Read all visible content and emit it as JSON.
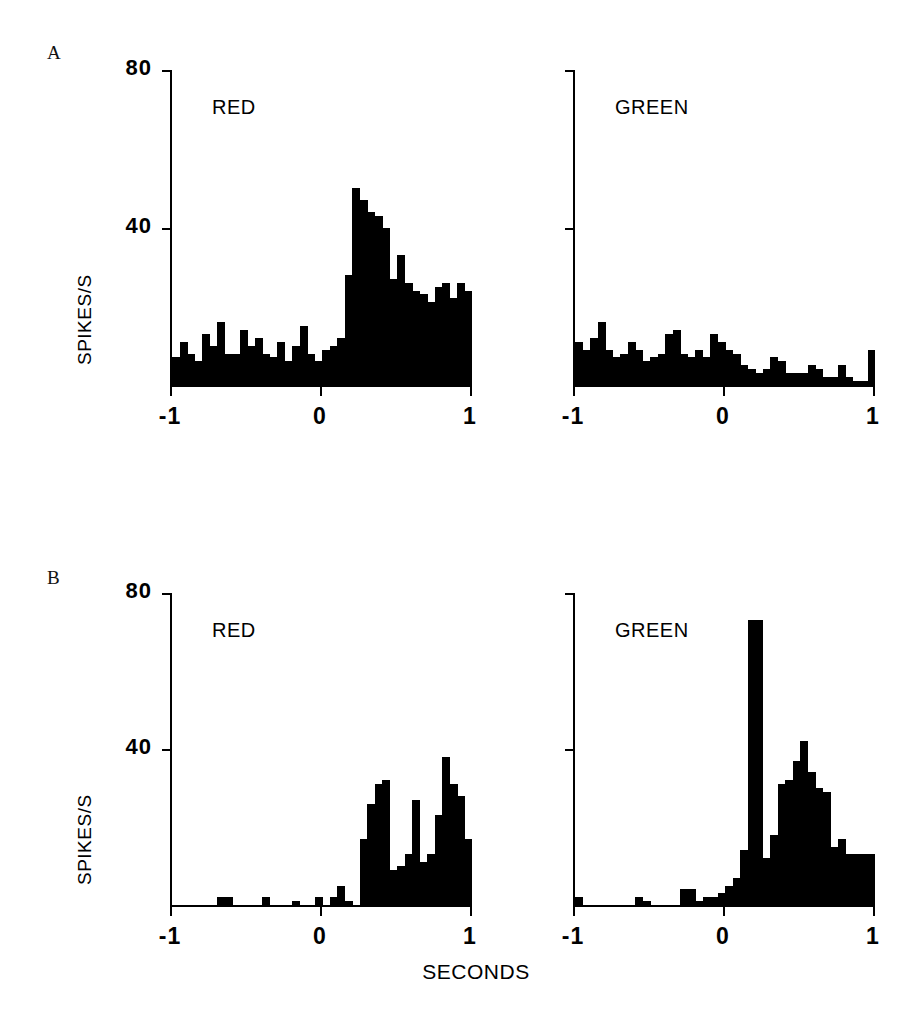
{
  "figure": {
    "panels": [
      {
        "letter": "A",
        "axis_title_y": "SPIKES/S",
        "plots": [
          {
            "condition": "RED",
            "y_ticks": [
              "80",
              "40"
            ],
            "x_ticks": [
              "-1",
              "0",
              "1"
            ]
          },
          {
            "condition": "GREEN",
            "y_ticks": [
              "",
              ""
            ],
            "x_ticks": [
              "-1",
              "0",
              "1"
            ]
          }
        ]
      },
      {
        "letter": "B",
        "axis_title_y": "SPIKES/S",
        "plots": [
          {
            "condition": "RED",
            "y_ticks": [
              "80",
              "40"
            ],
            "x_ticks": [
              "-1",
              "0",
              "1"
            ]
          },
          {
            "condition": "GREEN",
            "y_ticks": [
              "",
              ""
            ],
            "x_ticks": [
              "-1",
              "0",
              "1"
            ]
          }
        ]
      }
    ],
    "axis_title_x": "SECONDS",
    "ink_color": "#000000"
  },
  "chart_data": [
    {
      "type": "bar",
      "title": "A RED",
      "panel": "A",
      "condition": "RED",
      "xlabel": "SECONDS",
      "ylabel": "SPIKES/S",
      "xlim": [
        -1,
        1
      ],
      "ylim": [
        0,
        80
      ],
      "yticks": [
        40,
        80
      ],
      "xticks": [
        -1,
        0,
        1
      ],
      "grid": false,
      "bin_width": 0.05,
      "x": [
        -1.0,
        -0.95,
        -0.9,
        -0.85,
        -0.8,
        -0.75,
        -0.7,
        -0.65,
        -0.6,
        -0.55,
        -0.5,
        -0.45,
        -0.4,
        -0.35,
        -0.3,
        -0.25,
        -0.2,
        -0.15,
        -0.1,
        -0.05,
        0.0,
        0.05,
        0.1,
        0.15,
        0.2,
        0.25,
        0.3,
        0.35,
        0.4,
        0.45,
        0.5,
        0.55,
        0.6,
        0.65,
        0.7,
        0.75,
        0.8,
        0.85,
        0.9,
        0.95
      ],
      "values": [
        7,
        11,
        8,
        6,
        13,
        10,
        16,
        8,
        8,
        14,
        10,
        12,
        8,
        7,
        11,
        6,
        10,
        15,
        8,
        6,
        9,
        10,
        12,
        28,
        50,
        47,
        44,
        43,
        40,
        27,
        33,
        26,
        24,
        23,
        21,
        25,
        26,
        22,
        26,
        24
      ]
    },
    {
      "type": "bar",
      "title": "A GREEN",
      "panel": "A",
      "condition": "GREEN",
      "xlabel": "SECONDS",
      "ylabel": "SPIKES/S",
      "xlim": [
        -1,
        1
      ],
      "ylim": [
        0,
        80
      ],
      "yticks": [
        40,
        80
      ],
      "xticks": [
        -1,
        0,
        1
      ],
      "grid": false,
      "bin_width": 0.05,
      "x": [
        -1.0,
        -0.95,
        -0.9,
        -0.85,
        -0.8,
        -0.75,
        -0.7,
        -0.65,
        -0.6,
        -0.55,
        -0.5,
        -0.45,
        -0.4,
        -0.35,
        -0.3,
        -0.25,
        -0.2,
        -0.15,
        -0.1,
        -0.05,
        0.0,
        0.05,
        0.1,
        0.15,
        0.2,
        0.25,
        0.3,
        0.35,
        0.4,
        0.45,
        0.5,
        0.55,
        0.6,
        0.65,
        0.7,
        0.75,
        0.8,
        0.85,
        0.9,
        0.95
      ],
      "values": [
        11,
        9,
        12,
        16,
        9,
        7,
        8,
        11,
        9,
        6,
        7,
        8,
        13,
        14,
        8,
        7,
        9,
        7,
        13,
        11,
        9,
        8,
        5,
        4,
        3,
        4,
        7,
        6,
        3,
        3,
        3,
        5,
        4,
        2,
        2,
        5,
        2,
        1,
        1,
        9
      ]
    },
    {
      "type": "bar",
      "title": "B RED",
      "panel": "B",
      "condition": "RED",
      "xlabel": "SECONDS",
      "ylabel": "SPIKES/S",
      "xlim": [
        -1,
        1
      ],
      "ylim": [
        0,
        80
      ],
      "yticks": [
        40,
        80
      ],
      "xticks": [
        -1,
        0,
        1
      ],
      "grid": false,
      "bin_width": 0.05,
      "x": [
        -1.0,
        -0.95,
        -0.9,
        -0.85,
        -0.8,
        -0.75,
        -0.7,
        -0.65,
        -0.6,
        -0.55,
        -0.5,
        -0.45,
        -0.4,
        -0.35,
        -0.3,
        -0.25,
        -0.2,
        -0.15,
        -0.1,
        -0.05,
        0.0,
        0.05,
        0.1,
        0.15,
        0.2,
        0.25,
        0.3,
        0.35,
        0.4,
        0.45,
        0.5,
        0.55,
        0.6,
        0.65,
        0.7,
        0.75,
        0.8,
        0.85,
        0.9,
        0.95
      ],
      "values": [
        0,
        0,
        0,
        0,
        0,
        0,
        2,
        2,
        0,
        0,
        0,
        0,
        2,
        0,
        0,
        0,
        1,
        0,
        0,
        2,
        0,
        2,
        5,
        1,
        0,
        17,
        26,
        31,
        32,
        9,
        10,
        13,
        27,
        11,
        13,
        23,
        38,
        31,
        28,
        17
      ]
    },
    {
      "type": "bar",
      "title": "B GREEN",
      "panel": "B",
      "condition": "GREEN",
      "xlabel": "SECONDS",
      "ylabel": "SPIKES/S",
      "xlim": [
        -1,
        1
      ],
      "ylim": [
        0,
        80
      ],
      "yticks": [
        40,
        80
      ],
      "xticks": [
        -1,
        0,
        1
      ],
      "grid": false,
      "bin_width": 0.05,
      "x": [
        -1.0,
        -0.95,
        -0.9,
        -0.85,
        -0.8,
        -0.75,
        -0.7,
        -0.65,
        -0.6,
        -0.55,
        -0.5,
        -0.45,
        -0.4,
        -0.35,
        -0.3,
        -0.25,
        -0.2,
        -0.15,
        -0.1,
        -0.05,
        0.0,
        0.05,
        0.1,
        0.15,
        0.2,
        0.25,
        0.3,
        0.35,
        0.4,
        0.45,
        0.5,
        0.55,
        0.6,
        0.65,
        0.7,
        0.75,
        0.8,
        0.85,
        0.9,
        0.95
      ],
      "values": [
        2,
        0,
        0,
        0,
        0,
        0,
        0,
        0,
        2,
        1,
        0,
        0,
        0,
        0,
        4,
        4,
        1,
        2,
        2,
        3,
        5,
        7,
        14,
        73,
        73,
        12,
        18,
        31,
        32,
        37,
        42,
        34,
        30,
        29,
        15,
        17,
        13,
        13,
        13,
        13
      ]
    }
  ]
}
